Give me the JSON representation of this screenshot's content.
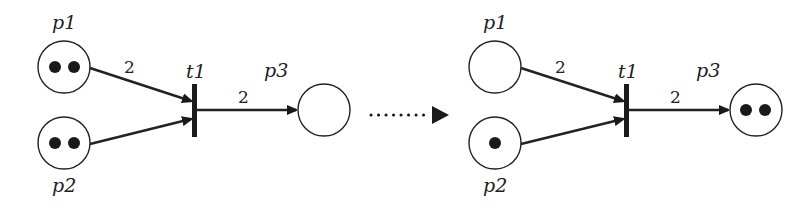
{
  "diagram": {
    "type": "petri-net-firing",
    "before": {
      "places": [
        {
          "id": "p1",
          "label": "p1",
          "tokens": 2
        },
        {
          "id": "p2",
          "label": "p2",
          "tokens": 2
        },
        {
          "id": "p3",
          "label": "p3",
          "tokens": 0
        }
      ],
      "transition": {
        "label": "t1"
      },
      "arcs": [
        {
          "from": "p1",
          "to": "t1",
          "weight": "2"
        },
        {
          "from": "p2",
          "to": "t1",
          "weight": ""
        },
        {
          "from": "t1",
          "to": "p3",
          "weight": "2"
        }
      ]
    },
    "after": {
      "places": [
        {
          "id": "p1",
          "label": "p1",
          "tokens": 0
        },
        {
          "id": "p2",
          "label": "p2",
          "tokens": 1
        },
        {
          "id": "p3",
          "label": "p3",
          "tokens": 2
        }
      ],
      "transition": {
        "label": "t1"
      },
      "arcs": [
        {
          "from": "p1",
          "to": "t1",
          "weight": "2"
        },
        {
          "from": "p2",
          "to": "t1",
          "weight": ""
        },
        {
          "from": "t1",
          "to": "p3",
          "weight": "2"
        }
      ]
    },
    "firing_arrow": "dotted"
  }
}
